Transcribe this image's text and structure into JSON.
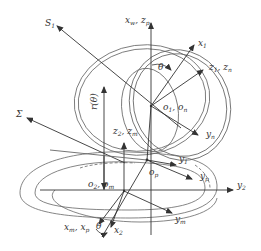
{
  "diagram": {
    "colors": {
      "stroke": "#555555",
      "arrow": "#333333",
      "text": "#333333",
      "background": "#ffffff"
    },
    "labels": {
      "s1": {
        "main": "S",
        "sub": "1"
      },
      "xw_zp": {
        "a": "x",
        "a_sub": "w",
        "sep": ", ",
        "b": "z",
        "b_sub": "p"
      },
      "x1": {
        "main": "x",
        "sub": "1"
      },
      "theta_top": {
        "main": "θ"
      },
      "z1_zn": {
        "a": "z",
        "a_sub": "1",
        "sep": ", ",
        "b": "z",
        "b_sub": "n"
      },
      "o1_on": {
        "a": "o",
        "a_sub": "1",
        "sep": ", ",
        "b": "o",
        "b_sub": "n"
      },
      "yn": {
        "main": "y",
        "sub": "n"
      },
      "sigma": {
        "main": "Σ"
      },
      "r_theta": {
        "main": "r(θ)"
      },
      "z2_zm": {
        "a": "z",
        "a_sub": "2",
        "sep": ", ",
        "b": "z",
        "b_sub": "m"
      },
      "y1": {
        "main": "y",
        "sub": "1"
      },
      "op": {
        "main": "o",
        "sub": "p"
      },
      "yp": {
        "main": "y",
        "sub": "p"
      },
      "o2_om": {
        "a": "o",
        "a_sub": "2",
        "sep": ", ",
        "b": "o",
        "b_sub": "m"
      },
      "y2": {
        "main": "y",
        "sub": "2"
      },
      "ym": {
        "main": "y",
        "sub": "m"
      },
      "xm_xp": {
        "a": "x",
        "a_sub": "m",
        "sep": ", ",
        "b": "x",
        "b_sub": "p"
      },
      "theta_bottom": {
        "main": "θ"
      },
      "x2": {
        "main": "x",
        "sub": "2"
      }
    }
  }
}
